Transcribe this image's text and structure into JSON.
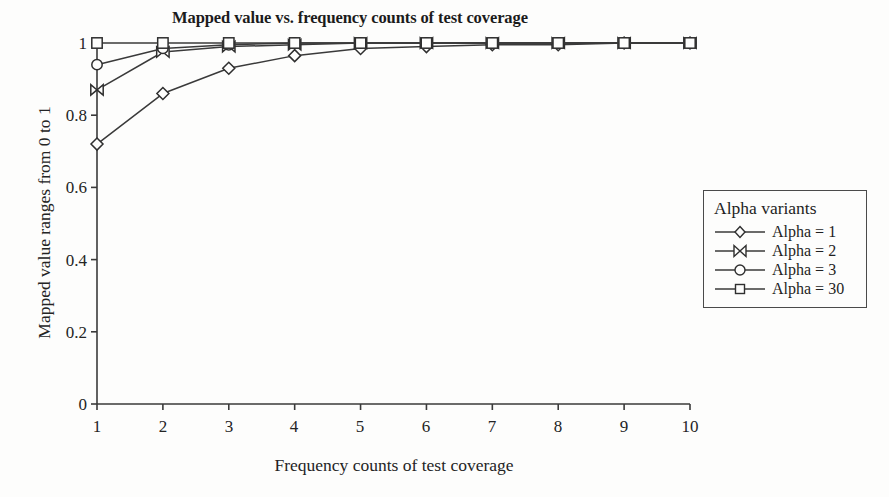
{
  "chart_data": {
    "type": "line",
    "title": "Mapped value vs. frequency counts of test coverage",
    "xlabel": "Frequency counts of test coverage",
    "ylabel": "Mapped value ranges from 0 to 1",
    "x": [
      1,
      2,
      3,
      4,
      5,
      6,
      7,
      8,
      9,
      10
    ],
    "xtick_labels": [
      "1",
      "2",
      "3",
      "4",
      "5",
      "6",
      "7",
      "8",
      "9",
      "10"
    ],
    "ytick_labels": [
      "0",
      "0.2",
      "0.4",
      "0.6",
      "0.8",
      "1"
    ],
    "ytick_values": [
      0,
      0.2,
      0.4,
      0.6,
      0.8,
      1
    ],
    "xlim": [
      1,
      10
    ],
    "ylim": [
      0,
      1
    ],
    "grid": false,
    "legend_position": "right-outside",
    "legend_title": "Alpha variants",
    "series": [
      {
        "name": "Alpha = 1",
        "marker": "diamond",
        "values": [
          0.72,
          0.86,
          0.93,
          0.965,
          0.985,
          0.99,
          0.995,
          0.995,
          1.0,
          1.0
        ]
      },
      {
        "name": "Alpha = 2",
        "marker": "bowtie",
        "values": [
          0.87,
          0.975,
          0.99,
          0.995,
          1.0,
          1.0,
          1.0,
          1.0,
          1.0,
          1.0
        ]
      },
      {
        "name": "Alpha = 3",
        "marker": "circle",
        "values": [
          0.94,
          0.985,
          0.995,
          1.0,
          1.0,
          1.0,
          1.0,
          1.0,
          1.0,
          1.0
        ]
      },
      {
        "name": "Alpha = 30",
        "marker": "square",
        "values": [
          1.0,
          1.0,
          1.0,
          1.0,
          1.0,
          1.0,
          1.0,
          1.0,
          1.0,
          1.0
        ]
      }
    ],
    "line_color": "#3a3a3a",
    "axis_color": "#3a3a3a",
    "background": "#fdfdfc"
  },
  "legend": {
    "title": "Alpha variants",
    "items": [
      {
        "label": "Alpha = 1",
        "marker": "diamond-marker"
      },
      {
        "label": "Alpha = 2",
        "marker": "bowtie-marker"
      },
      {
        "label": "Alpha = 3",
        "marker": "circle-marker"
      },
      {
        "label": "Alpha = 30",
        "marker": "square-marker"
      }
    ]
  }
}
